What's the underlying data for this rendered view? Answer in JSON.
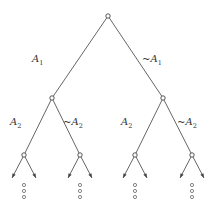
{
  "diagram": {
    "type": "probability-tree",
    "root": {
      "id": "root",
      "children": [
        {
          "id": "A1",
          "edge_label": {
            "prefix": "",
            "var": "A",
            "sub": "1"
          },
          "children": [
            {
              "id": "A1A2",
              "edge_label": {
                "prefix": "",
                "var": "A",
                "sub": "2"
              },
              "continues": true
            },
            {
              "id": "A1nA2",
              "edge_label": {
                "prefix": "~",
                "var": "A",
                "sub": "2"
              },
              "continues": true
            }
          ]
        },
        {
          "id": "nA1",
          "edge_label": {
            "prefix": "~",
            "var": "A",
            "sub": "1"
          },
          "children": [
            {
              "id": "nA1A2",
              "edge_label": {
                "prefix": "",
                "var": "A",
                "sub": "2"
              },
              "continues": true
            },
            {
              "id": "nA1nA2",
              "edge_label": {
                "prefix": "~",
                "var": "A",
                "sub": "2"
              },
              "continues": true
            }
          ]
        }
      ]
    },
    "continuation_marker": "vertical ellipsis (three small circles)",
    "colors": {
      "line": "#555555",
      "background": "#ffffff"
    }
  }
}
